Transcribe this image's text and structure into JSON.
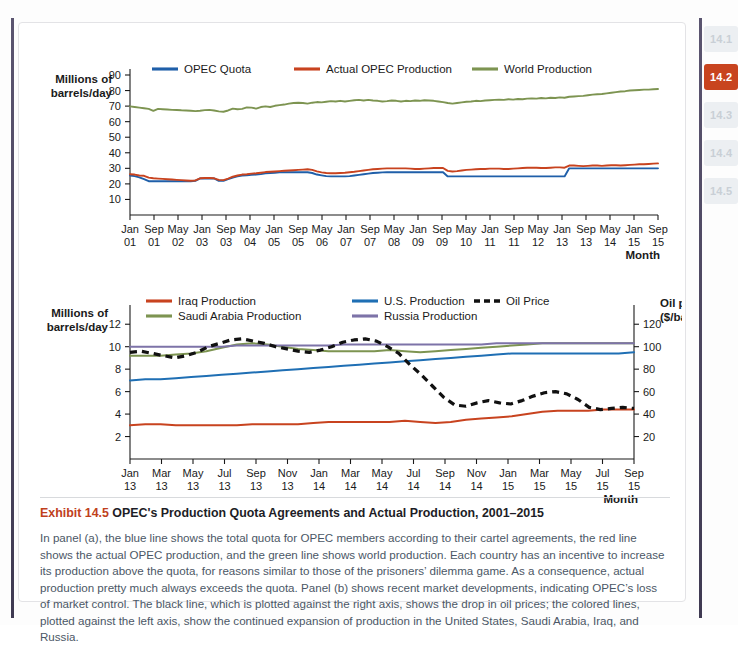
{
  "sidebar": {
    "items": [
      {
        "label": "14.1",
        "active": false
      },
      {
        "label": "14.2",
        "active": true
      },
      {
        "label": "14.3",
        "active": false
      },
      {
        "label": "14.4",
        "active": false
      },
      {
        "label": "14.5",
        "active": false
      }
    ]
  },
  "caption": {
    "exhibit_label": "Exhibit 14.5",
    "title": "OPEC's Production Quota Agreements and Actual Production, 2001–2015",
    "body": "In panel (a), the blue line shows the total quota for OPEC members according to their cartel agreements, the red line shows the actual OPEC production, and the green line shows world production. Each country has an incentive to increase its production above the quota, for reasons similar to those of the prisoners’ dilemma game. As a consequence, actual production pretty much always exceeds the quota. Panel (b) shows recent market developments, indicating OPEC’s loss of market control. The black line, which is plotted against the right axis, shows the drop in oil prices; the colored lines, plotted against the left axis, show the continued expansion of production in the United States, Saudi Arabia, Iraq, and Russia."
  },
  "colors": {
    "opec_quota": "#1f5fa9",
    "actual_opec": "#c8431f",
    "world_production": "#7d9451",
    "iraq": "#c8431f",
    "saudi": "#7d9451",
    "us": "#1f6fb4",
    "russia": "#7d73a8",
    "oil_price": "#111111",
    "accent": "#c0401c",
    "axis": "#1a1a1a"
  },
  "chart_data": [
    {
      "id": "panel-a",
      "type": "line",
      "title": "",
      "ylabel": "Millions of barrels/day",
      "xlabel": "Month",
      "ylim": [
        0,
        90
      ],
      "yticks": [
        10,
        20,
        30,
        40,
        50,
        60,
        70,
        80,
        90
      ],
      "grid": false,
      "legend_position": "top",
      "categories": [
        "Jan 01",
        "Sep 01",
        "May 02",
        "Jan 03",
        "Sep 03",
        "May 04",
        "Jan 05",
        "Sep 05",
        "May 06",
        "Jan 07",
        "Sep 07",
        "May 08",
        "Jan 09",
        "Sep 09",
        "May 10",
        "Jan 11",
        "Sep 11",
        "May 12",
        "Jan 13",
        "Sep 13",
        "May 14",
        "Jan 15",
        "Sep 15"
      ],
      "xtick_labels": [
        {
          "month": "Jan",
          "year": "01"
        },
        {
          "month": "Sep",
          "year": "01"
        },
        {
          "month": "May",
          "year": "02"
        },
        {
          "month": "Jan",
          "year": "03"
        },
        {
          "month": "Sep",
          "year": "03"
        },
        {
          "month": "May",
          "year": "04"
        },
        {
          "month": "Jan",
          "year": "05"
        },
        {
          "month": "Sep",
          "year": "05"
        },
        {
          "month": "May",
          "year": "06"
        },
        {
          "month": "Jan",
          "year": "07"
        },
        {
          "month": "Sep",
          "year": "07"
        },
        {
          "month": "May",
          "year": "08"
        },
        {
          "month": "Jan",
          "year": "09"
        },
        {
          "month": "Sep",
          "year": "09"
        },
        {
          "month": "May",
          "year": "10"
        },
        {
          "month": "Jan",
          "year": "11"
        },
        {
          "month": "Sep",
          "year": "11"
        },
        {
          "month": "May",
          "year": "12"
        },
        {
          "month": "Jan",
          "year": "13"
        },
        {
          "month": "Sep",
          "year": "13"
        },
        {
          "month": "May",
          "year": "14"
        },
        {
          "month": "Jan",
          "year": "15"
        },
        {
          "month": "Sep",
          "year": "15"
        }
      ],
      "series": [
        {
          "name": "OPEC Quota",
          "color": "#1f5fa9",
          "style": "solid",
          "values": [
            25.4,
            25.0,
            24.2,
            23.0,
            21.7,
            21.7,
            21.7,
            21.7,
            21.7,
            21.7,
            21.7,
            21.7,
            21.7,
            21.7,
            22.0,
            23.5,
            23.5,
            23.5,
            23.5,
            22.0,
            22.0,
            23.0,
            24.0,
            24.8,
            25.3,
            25.5,
            25.8,
            26.0,
            26.3,
            26.8,
            27.0,
            27.2,
            27.4,
            27.5,
            27.5,
            27.5,
            27.5,
            27.5,
            27.5,
            27.0,
            26.0,
            25.5,
            25.0,
            24.8,
            24.8,
            24.8,
            24.8,
            25.0,
            25.4,
            25.8,
            26.2,
            26.6,
            27.0,
            27.2,
            27.4,
            27.5,
            27.5,
            27.5,
            27.5,
            27.5,
            27.5,
            27.5,
            27.5,
            27.5,
            27.5,
            27.5,
            27.5,
            27.5,
            24.8,
            24.8,
            24.8,
            24.8,
            24.8,
            24.8,
            24.8,
            24.8,
            24.8,
            24.8,
            24.8,
            24.8,
            24.8,
            24.8,
            24.8,
            24.8,
            24.8,
            24.8,
            24.8,
            24.8,
            24.8,
            24.8,
            24.8,
            24.8,
            24.8,
            24.8,
            30.0,
            30.0,
            30.0,
            30.0,
            30.0,
            30.0,
            30.0,
            30.0,
            30.0,
            30.0,
            30.0,
            30.0,
            30.0,
            30.0,
            30.0,
            30.0,
            30.0,
            30.0,
            30.0,
            30.0
          ]
        },
        {
          "name": "Actual OPEC Production",
          "color": "#c8431f",
          "style": "solid",
          "values": [
            26.2,
            26.0,
            25.4,
            25.2,
            24.0,
            23.6,
            23.4,
            23.2,
            23.0,
            22.8,
            22.6,
            22.4,
            22.2,
            22.0,
            22.2,
            23.6,
            23.8,
            23.8,
            23.6,
            22.6,
            22.4,
            23.4,
            24.6,
            25.4,
            26.0,
            26.2,
            26.6,
            26.8,
            27.2,
            27.6,
            27.8,
            28.0,
            28.2,
            28.4,
            28.6,
            28.8,
            29.0,
            29.2,
            29.4,
            29.0,
            28.0,
            27.4,
            27.0,
            26.8,
            26.8,
            27.0,
            27.2,
            27.5,
            27.8,
            28.2,
            28.6,
            29.0,
            29.4,
            29.6,
            29.8,
            30.0,
            30.0,
            30.0,
            30.0,
            30.0,
            29.8,
            29.6,
            29.6,
            29.8,
            30.0,
            30.2,
            30.2,
            30.2,
            28.4,
            28.0,
            28.2,
            28.6,
            29.0,
            29.2,
            29.4,
            29.6,
            29.6,
            29.8,
            29.8,
            29.8,
            29.6,
            29.6,
            29.8,
            30.0,
            30.2,
            30.4,
            30.4,
            30.4,
            30.2,
            30.2,
            30.4,
            30.6,
            30.6,
            30.4,
            31.8,
            31.8,
            31.6,
            31.4,
            31.6,
            31.8,
            31.8,
            31.6,
            31.8,
            32.0,
            32.0,
            31.8,
            32.0,
            32.2,
            32.4,
            32.6,
            32.6,
            32.8,
            33.0,
            33.2
          ]
        },
        {
          "name": "World Production",
          "color": "#7d9451",
          "style": "solid",
          "values": [
            69.8,
            69.4,
            69.0,
            68.6,
            68.2,
            67.0,
            68.2,
            68.0,
            67.8,
            67.6,
            67.5,
            67.3,
            67.2,
            67.0,
            66.8,
            67.0,
            67.4,
            67.6,
            67.2,
            66.6,
            66.4,
            67.2,
            68.4,
            68.0,
            68.2,
            69.2,
            69.0,
            68.4,
            69.4,
            69.8,
            69.4,
            70.2,
            70.6,
            71.0,
            71.6,
            72.0,
            72.2,
            72.0,
            71.6,
            72.2,
            72.6,
            72.4,
            72.8,
            73.2,
            73.0,
            73.4,
            73.0,
            73.4,
            73.8,
            74.0,
            73.6,
            74.0,
            73.6,
            73.4,
            73.0,
            73.2,
            73.6,
            73.4,
            73.0,
            73.4,
            73.2,
            73.6,
            73.4,
            73.8,
            73.6,
            73.4,
            73.0,
            72.6,
            72.0,
            71.6,
            72.0,
            72.4,
            72.8,
            73.0,
            73.4,
            73.2,
            73.6,
            73.8,
            74.0,
            74.2,
            74.0,
            74.4,
            74.2,
            74.6,
            74.4,
            74.8,
            75.0,
            74.8,
            75.2,
            75.0,
            75.4,
            75.2,
            75.6,
            75.4,
            76.0,
            76.2,
            76.4,
            76.6,
            77.0,
            77.4,
            77.6,
            77.8,
            78.2,
            78.6,
            79.0,
            79.4,
            79.6,
            80.0,
            80.2,
            80.4,
            80.6,
            80.6,
            80.8,
            81.0
          ]
        }
      ]
    },
    {
      "id": "panel-b",
      "type": "line",
      "title": "",
      "ylabel": "Millions of barrels/day",
      "ylabel_right": "Oil price ($/barrel)",
      "xlabel": "Month",
      "ylim": [
        0,
        13
      ],
      "yticks": [
        2,
        4,
        6,
        8,
        10,
        12
      ],
      "ylim_right": [
        0,
        130
      ],
      "yticks_right": [
        20,
        40,
        60,
        80,
        100,
        120
      ],
      "grid": false,
      "legend_position": "top",
      "categories": [
        "Jan 13",
        "Mar 13",
        "May 13",
        "Jul 13",
        "Sep 13",
        "Nov 13",
        "Jan 14",
        "Mar 14",
        "May 14",
        "Jul 14",
        "Sep 14",
        "Nov 14",
        "Jan 15",
        "Mar 15",
        "May 15",
        "Jul 15",
        "Sep 15"
      ],
      "xtick_labels": [
        {
          "month": "Jan",
          "year": "13"
        },
        {
          "month": "Mar",
          "year": "13"
        },
        {
          "month": "May",
          "year": "13"
        },
        {
          "month": "Jul",
          "year": "13"
        },
        {
          "month": "Sep",
          "year": "13"
        },
        {
          "month": "Nov",
          "year": "13"
        },
        {
          "month": "Jan",
          "year": "14"
        },
        {
          "month": "Mar",
          "year": "14"
        },
        {
          "month": "May",
          "year": "14"
        },
        {
          "month": "Jul",
          "year": "14"
        },
        {
          "month": "Sep",
          "year": "14"
        },
        {
          "month": "Nov",
          "year": "14"
        },
        {
          "month": "Jan",
          "year": "15"
        },
        {
          "month": "Mar",
          "year": "15"
        },
        {
          "month": "May",
          "year": "15"
        },
        {
          "month": "Jul",
          "year": "15"
        },
        {
          "month": "Sep",
          "year": "15"
        }
      ],
      "series": [
        {
          "name": "Iraq Production",
          "color": "#c8431f",
          "style": "solid",
          "axis": "left",
          "values": [
            3.0,
            3.1,
            3.1,
            3.0,
            3.0,
            3.0,
            3.0,
            3.0,
            3.1,
            3.1,
            3.1,
            3.1,
            3.2,
            3.3,
            3.3,
            3.3,
            3.3,
            3.3,
            3.4,
            3.3,
            3.2,
            3.3,
            3.5,
            3.6,
            3.7,
            3.8,
            4.0,
            4.2,
            4.3,
            4.3,
            4.3,
            4.4,
            4.4,
            4.4
          ]
        },
        {
          "name": "Saudi Arabia Production",
          "color": "#7d9451",
          "style": "solid",
          "axis": "left",
          "values": [
            9.2,
            9.2,
            9.2,
            9.3,
            9.4,
            9.6,
            9.9,
            10.2,
            10.3,
            10.2,
            10.0,
            9.8,
            9.7,
            9.6,
            9.6,
            9.6,
            9.6,
            9.7,
            9.6,
            9.5,
            9.6,
            9.7,
            9.8,
            9.9,
            10.0,
            10.1,
            10.2,
            10.3,
            10.3,
            10.3,
            10.3,
            10.3,
            10.3,
            10.3
          ]
        },
        {
          "name": "U.S. Production",
          "color": "#1f6fb4",
          "style": "solid",
          "axis": "left",
          "values": [
            7.0,
            7.1,
            7.1,
            7.2,
            7.3,
            7.4,
            7.5,
            7.6,
            7.7,
            7.8,
            7.9,
            8.0,
            8.1,
            8.2,
            8.3,
            8.4,
            8.5,
            8.6,
            8.7,
            8.8,
            8.9,
            9.0,
            9.1,
            9.2,
            9.3,
            9.4,
            9.4,
            9.4,
            9.4,
            9.4,
            9.4,
            9.4,
            9.4,
            9.5
          ]
        },
        {
          "name": "Russia Production",
          "color": "#7d73a8",
          "style": "solid",
          "axis": "left",
          "values": [
            10.0,
            10.0,
            10.0,
            10.0,
            10.0,
            10.0,
            10.0,
            10.1,
            10.1,
            10.1,
            10.1,
            10.1,
            10.1,
            10.1,
            10.2,
            10.2,
            10.2,
            10.2,
            10.2,
            10.2,
            10.2,
            10.2,
            10.2,
            10.2,
            10.3,
            10.3,
            10.3,
            10.3,
            10.3,
            10.3,
            10.3,
            10.3,
            10.3,
            10.3
          ]
        },
        {
          "name": "Oil Price",
          "color": "#111111",
          "style": "dashed",
          "axis": "right",
          "values": [
            95,
            96,
            94,
            92,
            90,
            92,
            95,
            100,
            103,
            106,
            107,
            105,
            103,
            100,
            98,
            96,
            95,
            97,
            100,
            104,
            106,
            107,
            105,
            100,
            94,
            84,
            75,
            65,
            55,
            48,
            47,
            50,
            52,
            50,
            49,
            52,
            56,
            59,
            60,
            58,
            53,
            46,
            44,
            45,
            46,
            45
          ]
        }
      ]
    }
  ]
}
